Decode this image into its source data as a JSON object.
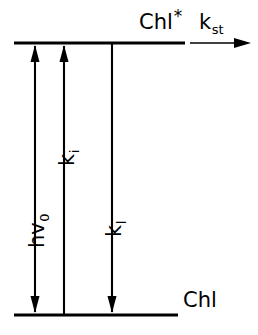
{
  "diagram": {
    "type": "jablonski-energy-level",
    "colors": {
      "ink": "#000000",
      "background": "#ffffff"
    },
    "levels": [
      {
        "id": "excited",
        "label": "Chl",
        "superscript": "*",
        "y": 43,
        "x_start": 14,
        "x_end": 185
      },
      {
        "id": "ground",
        "label": "Chl",
        "superscript": "",
        "y": 315,
        "x_start": 14,
        "x_end": 178
      }
    ],
    "transitions": [
      {
        "id": "absorption",
        "label": "hv",
        "subscript": "0",
        "x": 35,
        "direction": "double-vertical",
        "from_y": 43,
        "to_y": 315
      },
      {
        "id": "internal",
        "label": "k",
        "subscript": "i",
        "x": 64,
        "direction": "up",
        "from_y": 315,
        "to_y": 43
      },
      {
        "id": "loss",
        "label": "k",
        "subscript": "l",
        "x": 112,
        "direction": "down",
        "from_y": 43,
        "to_y": 315
      },
      {
        "id": "transfer",
        "label": "k",
        "subscript": "st",
        "x_start": 190,
        "x_end": 250,
        "y": 43,
        "direction": "right"
      }
    ]
  }
}
